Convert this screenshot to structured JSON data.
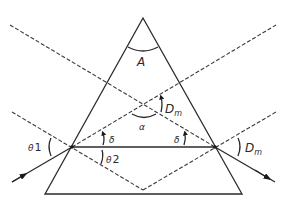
{
  "diagram": {
    "labels": {
      "apex_angle": "A",
      "min_deviation_center": "D",
      "min_deviation_center_sub": "m",
      "alpha": "α",
      "delta_left": "δ",
      "delta_right": "δ",
      "theta1": "θ",
      "theta1_sub": "1",
      "theta2": "θ",
      "theta2_sub": "2",
      "min_deviation_exit": "D",
      "min_deviation_exit_sub": "m"
    },
    "colors": {
      "line": "#2a2a2a",
      "background": "#ffffff"
    }
  }
}
